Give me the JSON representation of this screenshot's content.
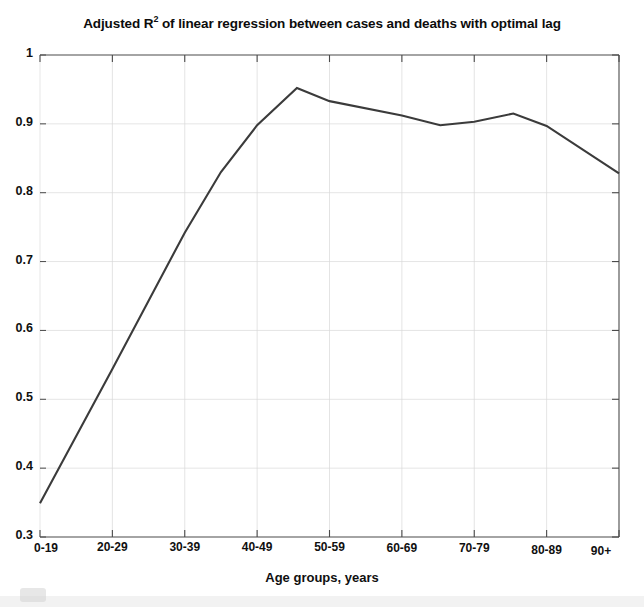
{
  "figure": {
    "title_prefix": "Adjusted R",
    "title_exponent": "2",
    "title_suffix": " of linear regression between cases and deaths with optimal lag",
    "title_full": "Adjusted R2 of linear regression between cases and deaths with optimal lag",
    "line_color": "#3b3b3b",
    "axis_color": "#4a4a4a",
    "grid_color": "#d9d9d9",
    "background_color": "#ffffff"
  },
  "chart_data": {
    "type": "line",
    "title": "Adjusted R2 of linear regression between cases and deaths with optimal lag",
    "xlabel": "Age groups, years",
    "ylabel": "",
    "categories": [
      "0-19",
      "20-29",
      "30-39",
      "40-49",
      "50-59",
      "60-69",
      "70-79",
      "80-89",
      "90+"
    ],
    "xticklabels": [
      "0-19",
      "20-29",
      "30-39",
      "40-49",
      "50-59",
      "60-69",
      "70-79",
      "80-89",
      "90+"
    ],
    "yticklabels": [
      "0.3",
      "0.4",
      "0.5",
      "0.6",
      "0.7",
      "0.8",
      "0.9",
      "1"
    ],
    "yticks": [
      0.3,
      0.4,
      0.5,
      0.6,
      0.7,
      0.8,
      0.9,
      1
    ],
    "ylim": [
      0.3,
      1
    ],
    "xlim": [
      0,
      8
    ],
    "grid": true,
    "legend": false,
    "series": [
      {
        "name": "Adjusted R2",
        "x": [
          0,
          1,
          2,
          2.5,
          3,
          3.55,
          4,
          5,
          5.53,
          6,
          6.54,
          7,
          8
        ],
        "values": [
          0.349,
          0.544,
          0.742,
          0.83,
          0.898,
          0.952,
          0.933,
          0.912,
          0.898,
          0.903,
          0.915,
          0.897,
          0.828
        ]
      }
    ],
    "values_at_categories": [
      0.349,
      0.544,
      0.742,
      0.83,
      0.952,
      0.912,
      0.903,
      0.915,
      0.828
    ],
    "annotations": []
  },
  "yaxis": {
    "ticks": [
      {
        "label": "1",
        "value": 1.0
      },
      {
        "label": "0.9",
        "value": 0.9
      },
      {
        "label": "0.8",
        "value": 0.8
      },
      {
        "label": "0.7",
        "value": 0.7
      },
      {
        "label": "0.6",
        "value": 0.6
      },
      {
        "label": "0.5",
        "value": 0.5
      },
      {
        "label": "0.4",
        "value": 0.4
      },
      {
        "label": "0.3",
        "value": 0.3
      }
    ]
  },
  "xaxis": {
    "label": "Age groups, years",
    "ticks": [
      {
        "label": "0-19"
      },
      {
        "label": "20-29"
      },
      {
        "label": "30-39"
      },
      {
        "label": "40-49"
      },
      {
        "label": "50-59"
      },
      {
        "label": "60-69"
      },
      {
        "label": "70-79"
      },
      {
        "label": "80-89"
      },
      {
        "label": "90+"
      }
    ]
  }
}
